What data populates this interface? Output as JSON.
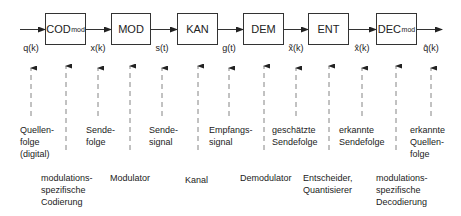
{
  "blocks": [
    {
      "id": "cod",
      "name": "COD",
      "sub": "mod",
      "x": 45,
      "w": 41,
      "desc": "modulations-\nspezifische\nCodierung"
    },
    {
      "id": "mod",
      "name": "MOD",
      "sub": "",
      "x": 111,
      "w": 40,
      "desc": "Modulator"
    },
    {
      "id": "kan",
      "name": "KAN",
      "sub": "",
      "x": 177,
      "w": 41,
      "desc": "Kanal"
    },
    {
      "id": "dem",
      "name": "DEM",
      "sub": "",
      "x": 243,
      "w": 41,
      "desc": "Demodulator"
    },
    {
      "id": "ent",
      "name": "ENT",
      "sub": "",
      "x": 308,
      "w": 41,
      "desc": "Entscheider,\nQuantisierer"
    },
    {
      "id": "dec",
      "name": "DEC",
      "sub": "mod",
      "x": 376,
      "w": 41,
      "desc": "modulations-\nspezifische\nDecodierung"
    }
  ],
  "signals": [
    {
      "label": "q(k)",
      "x": 31,
      "desc": "Quellen-\nfolge\n(digital)"
    },
    {
      "label": "x(k)",
      "x": 98,
      "desc": "Sende-\nfolge"
    },
    {
      "label": "s(t)",
      "x": 162,
      "desc": "Sende-\nsignal"
    },
    {
      "label": "g(t)",
      "x": 229,
      "desc": "Empfangs-\nsignal"
    },
    {
      "label": "x̃(k)",
      "x": 296,
      "desc": "geschätzte\nSendefolge"
    },
    {
      "label": "x̂(k)",
      "x": 362,
      "desc": "erkannte\nSendefolge"
    },
    {
      "label": "q̂(k)",
      "x": 431,
      "desc": "erkannte\nQuellen-\nfolge"
    }
  ],
  "block_desc": {
    "cod": "modulations-\nspezifische\nCodierung",
    "mod": "Modulator",
    "kan": "Kanal",
    "dem": "Demodulator",
    "ent": "Entscheider,\nQuantisierer",
    "dec": "modulations-\nspezifische\nDecodierung"
  },
  "colors": {
    "line": "#333333",
    "text": "#222222",
    "dashed": "#666666"
  }
}
